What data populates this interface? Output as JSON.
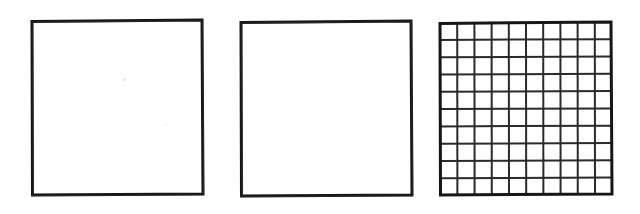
{
  "figure": {
    "canvas": {
      "width": 640,
      "height": 214
    },
    "background_color": "#ffffff",
    "stroke_color": "#161616",
    "grid_line_color": "#2a2a2a",
    "style": "hand-drawn scanned line art",
    "shape_count": 3
  },
  "shapes": [
    {
      "name": "square-empty-left",
      "label": "Empty square (left)",
      "kind": "square",
      "fill": "none",
      "stroke_color": "#161616",
      "stroke_width": 3,
      "x": 32,
      "y": 20,
      "width": 171,
      "height": 175,
      "subdivided": false,
      "rows": 1,
      "columns": 1,
      "cell_count": 1
    },
    {
      "name": "square-empty-middle",
      "label": "Empty square (middle)",
      "kind": "square",
      "fill": "none",
      "stroke_color": "#161616",
      "stroke_width": 3,
      "x": 241,
      "y": 21,
      "width": 171,
      "height": 175,
      "subdivided": false,
      "rows": 1,
      "columns": 1,
      "cell_count": 1
    },
    {
      "name": "square-grid-right",
      "label": "Gridded square (right)",
      "kind": "square",
      "fill": "none",
      "stroke_color": "#161616",
      "stroke_width": 3,
      "grid_line_color": "#2a2a2a",
      "grid_line_width": 2,
      "x": 440,
      "y": 22,
      "width": 172,
      "height": 173,
      "subdivided": true,
      "rows": 10,
      "columns": 10,
      "cell_count": 100
    }
  ]
}
